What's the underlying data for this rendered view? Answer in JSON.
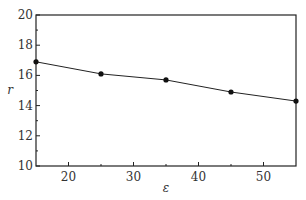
{
  "chart_data": {
    "type": "line",
    "title": "",
    "xlabel": "ε",
    "ylabel": "r",
    "xlim": [
      15,
      55
    ],
    "ylim": [
      10,
      20
    ],
    "x_ticks": [
      20,
      30,
      40,
      50
    ],
    "x_minor_ticks": [
      25,
      35,
      45
    ],
    "y_ticks": [
      10,
      12,
      14,
      16,
      18,
      20
    ],
    "y_minor_ticks": [
      11,
      13,
      15,
      17,
      19
    ],
    "grid": false,
    "legend": null,
    "series": [
      {
        "name": "r",
        "marker": "circle",
        "color": "#111111",
        "x": [
          15,
          25,
          35,
          45,
          55
        ],
        "values": [
          16.9,
          16.1,
          15.7,
          14.9,
          14.3
        ]
      }
    ]
  }
}
